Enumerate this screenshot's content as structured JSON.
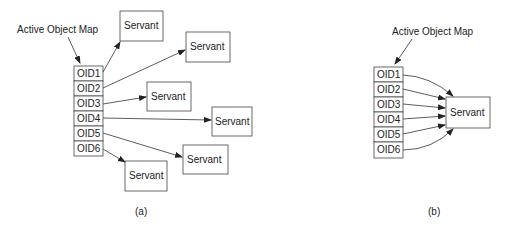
{
  "diagram_a": {
    "label": "Active Object Map",
    "oids": [
      "OID1",
      "OID2",
      "OID3",
      "OID4",
      "OID5",
      "OID6"
    ],
    "servants": [
      "Servant",
      "Servant",
      "Servant",
      "Servant",
      "Servant",
      "Servant"
    ],
    "caption": "(a)"
  },
  "diagram_b": {
    "label": "Active Object Map",
    "oids": [
      "OID1",
      "OID2",
      "OID3",
      "OID4",
      "OID5",
      "OID6"
    ],
    "servant": "Servant",
    "caption": "(b)"
  },
  "colors": {
    "stroke": "#444444",
    "text": "#222222",
    "background": "#ffffff"
  }
}
